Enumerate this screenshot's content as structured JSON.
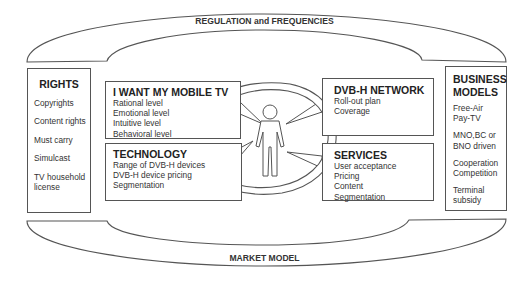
{
  "bands": {
    "top": "REGULATION and FREQUENCIES",
    "bottom": "MARKET MODEL"
  },
  "rights": {
    "title": "RIGHTS",
    "items": [
      "Copyrights",
      "Content rights",
      "Must carry",
      "Simulcast",
      "TV household license"
    ]
  },
  "want": {
    "title": "I WANT MY MOBILE TV",
    "items": [
      "Rational level",
      "Emotional level",
      "Intuitive level",
      "Behavioral level"
    ]
  },
  "technology": {
    "title": "TECHNOLOGY",
    "items": [
      "Range of DVB-H devices",
      "DVB-H device pricing",
      "Segmentation"
    ]
  },
  "network": {
    "title": "DVB-H NETWORK",
    "items": [
      "Roll-out plan",
      "Coverage"
    ]
  },
  "services": {
    "title": "SERVICES",
    "items": [
      "User acceptance",
      "Pricing",
      "Content",
      "Segmentation"
    ]
  },
  "business": {
    "title_line1": "BUSINESS",
    "title_line2": "MODELS",
    "items": [
      "Free-Air Pay-TV",
      "MNO,BC or BNO driven",
      "Cooperation Competition",
      "Terminal subsidy"
    ]
  },
  "center": {
    "icon": "person-icon",
    "cycle": "circular-arrow-icon"
  },
  "colors": {
    "stroke": "#555555",
    "text": "#2a2a2a",
    "background": "#ffffff"
  }
}
